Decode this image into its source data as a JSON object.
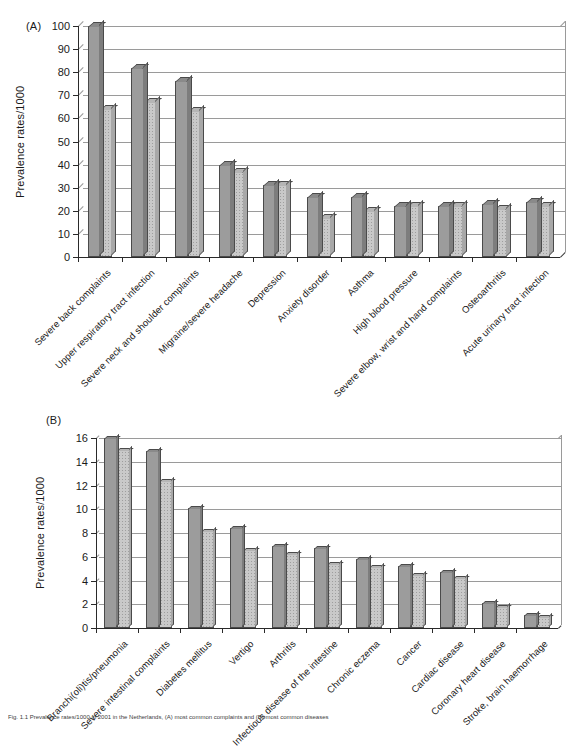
{
  "figure": {
    "caption": "Fig. 1.1  Prevalence rates/1000 in 2001 in the Netherlands, (A) most common complaints and (B) most common diseases"
  },
  "panels": [
    {
      "letter": "(A)",
      "ylabel": "Prevalence rates/1000",
      "yticks": [
        0,
        10,
        20,
        30,
        40,
        50,
        60,
        70,
        80,
        90,
        100
      ]
    },
    {
      "letter": "(B)",
      "ylabel": "Prevalence rates/1000",
      "yticks": [
        0,
        2,
        4,
        6,
        8,
        10,
        12,
        14,
        16
      ]
    }
  ],
  "chart_data": [
    {
      "type": "bar",
      "title": "(A)",
      "xlabel": "",
      "ylabel": "Prevalence rates/1000",
      "ylim": [
        0,
        100
      ],
      "ytick_step": 10,
      "grid": true,
      "legend": "none",
      "categories": [
        "Severe back complaints",
        "Upper respiratory tract infection",
        "Severe neck and shoulder complaints",
        "Migraine/severe headache",
        "Depression",
        "Anxiety disorder",
        "Asthma",
        "High blood pressure",
        "Severe elbow, wrist and hand complaints",
        "Osteoarthritis",
        "Acute urinary tract infection"
      ],
      "series": [
        {
          "name": "series-1",
          "color": "#9c9c9c",
          "values": [
            100,
            82,
            76,
            40,
            31,
            26,
            26,
            22,
            22,
            23,
            24
          ]
        },
        {
          "name": "series-2",
          "color": "#c9c9c9",
          "values": [
            64,
            67,
            63,
            37,
            31,
            17,
            20,
            22,
            22,
            21,
            22
          ]
        }
      ]
    },
    {
      "type": "bar",
      "title": "(B)",
      "xlabel": "",
      "ylabel": "Prevalence rates/1000",
      "ylim": [
        0,
        16
      ],
      "ytick_step": 2,
      "grid": true,
      "legend": "none",
      "categories": [
        "Branchi(oli)tis/pneumonia",
        "Severe intestinal complaints",
        "Diabetes mellitus",
        "Vertigo",
        "Arthritis",
        "Infectious disease of the intestine",
        "Chronic eczema",
        "Cancer",
        "Cardiac disease",
        "Coronary heart disease",
        "Stroke, brain haemorrhage"
      ],
      "series": [
        {
          "name": "series-1",
          "color": "#9c9c9c",
          "values": [
            16.0,
            14.9,
            10.1,
            8.4,
            6.9,
            6.7,
            5.8,
            5.2,
            4.7,
            2.1,
            1.1
          ]
        },
        {
          "name": "series-2",
          "color": "#c9c9c9",
          "values": [
            15.0,
            12.4,
            8.2,
            6.6,
            6.2,
            5.4,
            5.1,
            4.5,
            4.2,
            1.8,
            0.9
          ]
        }
      ]
    }
  ]
}
